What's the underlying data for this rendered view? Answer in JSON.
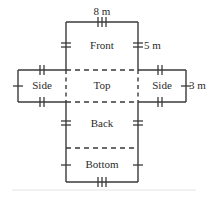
{
  "diagram": {
    "type": "box-net",
    "background_color": "#ffffff",
    "line_color": "#3a3a3a",
    "dashed_color": "#3a3a3a",
    "baseline_color": "#e0e0e0",
    "faces": [
      {
        "id": "front",
        "label": "Front",
        "x": 66,
        "y": 22,
        "w": 72,
        "h": 48,
        "border": "solid"
      },
      {
        "id": "side_left",
        "label": "Side",
        "x": 18,
        "y": 70,
        "w": 48,
        "h": 32,
        "border": "solid"
      },
      {
        "id": "top",
        "label": "Top",
        "x": 66,
        "y": 70,
        "w": 72,
        "h": 32,
        "border": "dashed"
      },
      {
        "id": "side_right",
        "label": "Side",
        "x": 138,
        "y": 70,
        "w": 48,
        "h": 32,
        "border": "solid"
      },
      {
        "id": "back",
        "label": "Back",
        "x": 66,
        "y": 102,
        "w": 72,
        "h": 46,
        "border": "solid"
      },
      {
        "id": "bottom",
        "label": "Bottom",
        "x": 66,
        "y": 148,
        "w": 72,
        "h": 34,
        "border": "solid"
      }
    ],
    "dimensions": [
      {
        "id": "width",
        "text": "8 m",
        "x": 90,
        "y": 8,
        "edge": "top-of-front",
        "ticks": 3
      },
      {
        "id": "height",
        "text": "5 m",
        "x": 146,
        "y": 40,
        "edge": "right-of-front",
        "ticks": 2
      },
      {
        "id": "depth",
        "text": "3 m",
        "x": 190,
        "y": 81,
        "edge": "right-of-side",
        "ticks": 1
      }
    ],
    "tick_marks": {
      "triple": [
        "top-edge-front",
        "bottom-edge-bottom"
      ],
      "double": [
        "left-edge-front",
        "right-edge-front",
        "left-edge-back",
        "right-edge-back",
        "top-edge-side-left",
        "bottom-edge-side-left",
        "top-edge-side-right",
        "bottom-edge-side-right"
      ],
      "single": [
        "left-edge-side-left",
        "right-edge-side-right",
        "left-edge-bottom",
        "right-edge-bottom"
      ]
    }
  }
}
